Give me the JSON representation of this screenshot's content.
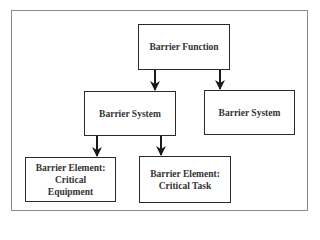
{
  "diagram": {
    "type": "hierarchy",
    "nodes": [
      {
        "id": "barrier-function",
        "label": "Barrier Function"
      },
      {
        "id": "barrier-system-left",
        "label": "Barrier System"
      },
      {
        "id": "barrier-system-right",
        "label": "Barrier System"
      },
      {
        "id": "barrier-element-equipment",
        "label_line1": "Barrier Element:",
        "label_line2": "Critical",
        "label_line3": "Equipment"
      },
      {
        "id": "barrier-element-task",
        "label_line1": "Barrier Element:",
        "label_line2": "Critical Task"
      }
    ],
    "edges": [
      {
        "from": "barrier-function",
        "to": "barrier-system-left"
      },
      {
        "from": "barrier-function",
        "to": "barrier-system-right"
      },
      {
        "from": "barrier-system-left",
        "to": "barrier-element-equipment"
      },
      {
        "from": "barrier-system-left",
        "to": "barrier-element-task"
      }
    ]
  }
}
